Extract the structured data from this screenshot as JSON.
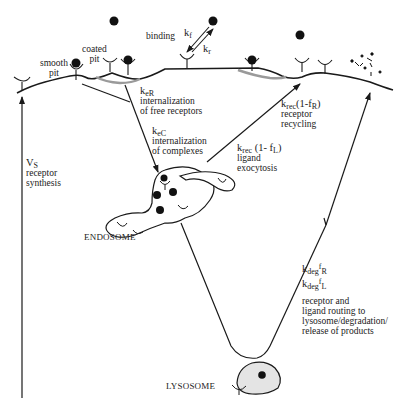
{
  "figure": {
    "membrane_labels": {
      "smooth_pit": [
        "smooth",
        "pit"
      ],
      "coated_pit": [
        "coated",
        "pit"
      ],
      "binding": "binding"
    },
    "rates": {
      "kf": {
        "base": "k",
        "sub": "f"
      },
      "kr": {
        "base": "k",
        "sub": "r"
      },
      "keR": {
        "base": "k",
        "sub": "eR",
        "desc": [
          "internalization",
          "of free receptors"
        ]
      },
      "keC": {
        "base": "k",
        "sub": "eC",
        "desc": [
          "internalization",
          "of complexes"
        ]
      },
      "krec_fL": {
        "base": "k",
        "sub": "rec",
        "tail": "(1- f",
        "tail_sub": "L",
        "tail_end": ")",
        "desc": [
          "ligand",
          "exocytosis"
        ]
      },
      "krec_fR": {
        "base": "k",
        "sub": "rec",
        "tail": "(1-f",
        "tail_sub": "R",
        "tail_end": ")",
        "desc": [
          "receptor",
          "recycling"
        ]
      },
      "Vs": {
        "base": "V",
        "sub": "S",
        "desc": [
          "receptor",
          "synthesis"
        ]
      },
      "kdeg_fR": {
        "base": "k",
        "sub": "deg",
        "mid": "f",
        "mid_sub": "R"
      },
      "kdeg_fL": {
        "base": "k",
        "sub": "deg",
        "mid": "f",
        "mid_sub": "L"
      },
      "deg_desc": [
        "receptor and",
        "ligand routing to",
        "lysosome/degradation/",
        "release of products"
      ]
    },
    "compartments": {
      "endosome": "ENDOSOME",
      "lysosome": "LYSOSOME"
    },
    "colors": {
      "line": "#1a1a1a",
      "coated_pit_shade": "#9a9a9a",
      "lysosome_fill": "#e4e4e4",
      "ligand": "#111111"
    }
  }
}
